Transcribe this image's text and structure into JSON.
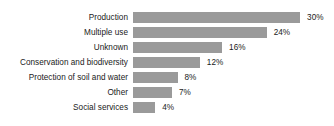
{
  "chart_data": {
    "type": "bar",
    "orientation": "horizontal",
    "title": "",
    "subtitle": "",
    "xlabel": "",
    "ylabel": "",
    "grid": false,
    "legend": null,
    "axis_visible": false,
    "value_suffix": "%",
    "xlim": [
      0,
      30
    ],
    "bar_color": "#9a9a9a",
    "text_color": "#1a1a1a",
    "background": "#ffffff",
    "categories": [
      "Production",
      "Multiple use",
      "Unknown",
      "Conservation and biodiversity",
      "Protection of soil and water",
      "Other",
      "Social services"
    ],
    "values": [
      30,
      24,
      16,
      12,
      8,
      7,
      4
    ],
    "value_labels": [
      "30%",
      "24%",
      "16%",
      "12%",
      "8%",
      "7%",
      "4%"
    ]
  },
  "rows": [
    {
      "label": "Production",
      "value": 30,
      "value_label": "30%"
    },
    {
      "label": "Multiple use",
      "value": 24,
      "value_label": "24%"
    },
    {
      "label": "Unknown",
      "value": 16,
      "value_label": "16%"
    },
    {
      "label": "Conservation and biodiversity",
      "value": 12,
      "value_label": "12%"
    },
    {
      "label": "Protection of soil and water",
      "value": 8,
      "value_label": "8%"
    },
    {
      "label": "Other",
      "value": 7,
      "value_label": "7%"
    },
    {
      "label": "Social services",
      "value": 4,
      "value_label": "4%"
    }
  ]
}
